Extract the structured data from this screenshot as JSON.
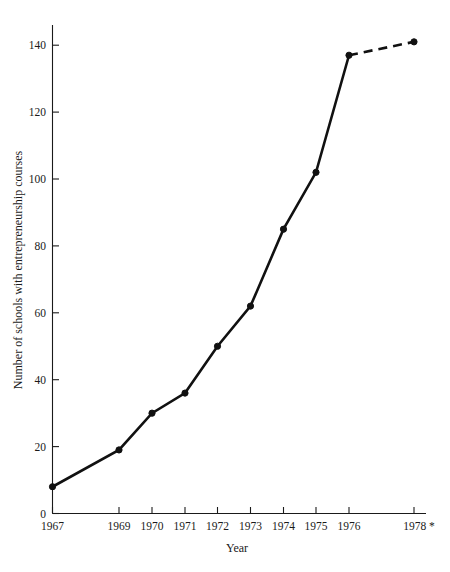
{
  "chart_data": {
    "type": "line",
    "title": "",
    "xlabel": "Year",
    "ylabel": "Number of schools with entrepreneurship courses",
    "categories": [
      "1967",
      "1969",
      "1970",
      "1971",
      "1972",
      "1973",
      "1974",
      "1975",
      "1976",
      "1978 *"
    ],
    "x": [
      1967,
      1969,
      1970,
      1971,
      1972,
      1973,
      1974,
      1975,
      1976,
      1978
    ],
    "values": [
      8,
      19,
      30,
      36,
      50,
      62,
      85,
      102,
      137,
      141
    ],
    "series": [
      {
        "name": "Number of schools with entrepreneurship courses",
        "values": [
          8,
          19,
          30,
          36,
          50,
          62,
          85,
          102,
          137,
          141
        ],
        "style": "solid-with-dashed-final-segment",
        "marker": "filled-circle",
        "color": "#111111"
      }
    ],
    "dashed_segment": {
      "from_category": "1976",
      "to_category": "1978 *",
      "from_value": 137,
      "to_value": 141
    },
    "xlim": [
      1967,
      1978
    ],
    "ylim": [
      0,
      148
    ],
    "ytick_labels": [
      "0",
      "20",
      "40",
      "60",
      "80",
      "100",
      "120",
      "140"
    ],
    "yticks": [
      0,
      20,
      40,
      60,
      80,
      100,
      120,
      140
    ],
    "xtick_labels": [
      "1967",
      "1969",
      "1970",
      "1971",
      "1972",
      "1973",
      "1974",
      "1975",
      "1976",
      "1978 *"
    ],
    "grid": false,
    "legend": "none",
    "footnote_marker": "*"
  },
  "axes": {
    "y_axis_title": "Number of schools with entrepreneurship courses",
    "x_axis_title": "Year"
  },
  "colors": {
    "line": "#111111",
    "axis": "#1a1a1a",
    "background": "#ffffff",
    "text": "#1a1a1a"
  }
}
